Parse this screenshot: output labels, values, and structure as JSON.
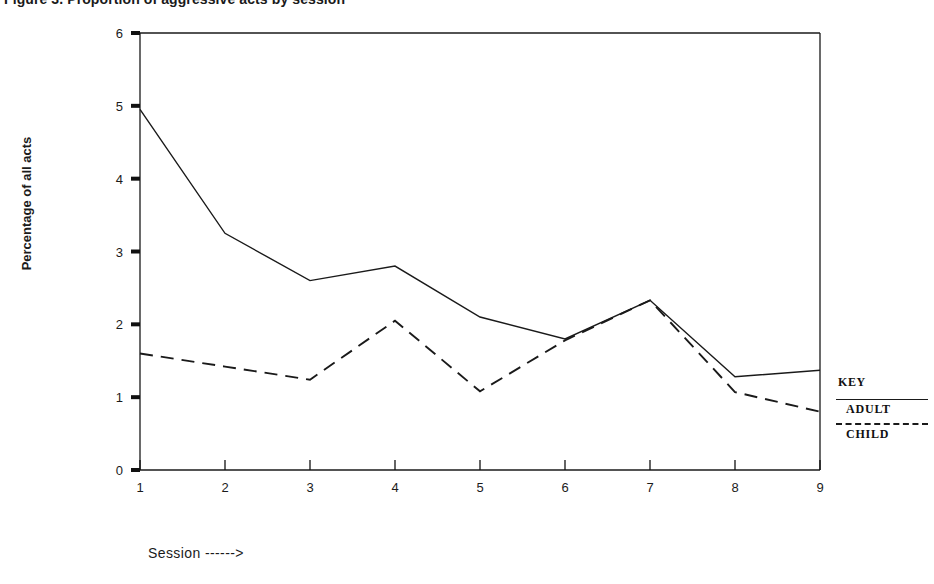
{
  "figure": {
    "title": "Figure 3. Proportion of aggressive acts by session",
    "ylabel": "Percentage of all acts",
    "xlabel": "Session ------>"
  },
  "legend": {
    "heading": "KEY",
    "entries": [
      {
        "label": "ADULT",
        "style": "solid"
      },
      {
        "label": "CHILD",
        "style": "dashed"
      }
    ]
  },
  "axes": {
    "y_ticks": [
      "0",
      "1",
      "2",
      "3",
      "4",
      "5",
      "6"
    ],
    "x_ticks": [
      "1",
      "2",
      "3",
      "4",
      "5",
      "6",
      "7",
      "8",
      "9"
    ]
  },
  "chart_data": {
    "type": "line",
    "title": "Figure 3. Proportion of aggressive acts by session",
    "xlabel": "Session ------>",
    "ylabel": "Percentage of all acts",
    "x": [
      1,
      2,
      3,
      4,
      5,
      6,
      7,
      8,
      9
    ],
    "xlim": [
      1,
      9
    ],
    "ylim": [
      0,
      6
    ],
    "grid": false,
    "legend_position": "right",
    "series": [
      {
        "name": "ADULT",
        "style": "solid",
        "color": "#1a1a1a",
        "values": [
          4.95,
          3.25,
          2.6,
          2.8,
          2.1,
          1.8,
          2.33,
          1.28,
          1.37
        ]
      },
      {
        "name": "CHILD",
        "style": "dashed",
        "color": "#1a1a1a",
        "values": [
          1.6,
          1.42,
          1.24,
          2.05,
          1.08,
          1.78,
          2.33,
          1.07,
          0.8
        ]
      }
    ]
  }
}
